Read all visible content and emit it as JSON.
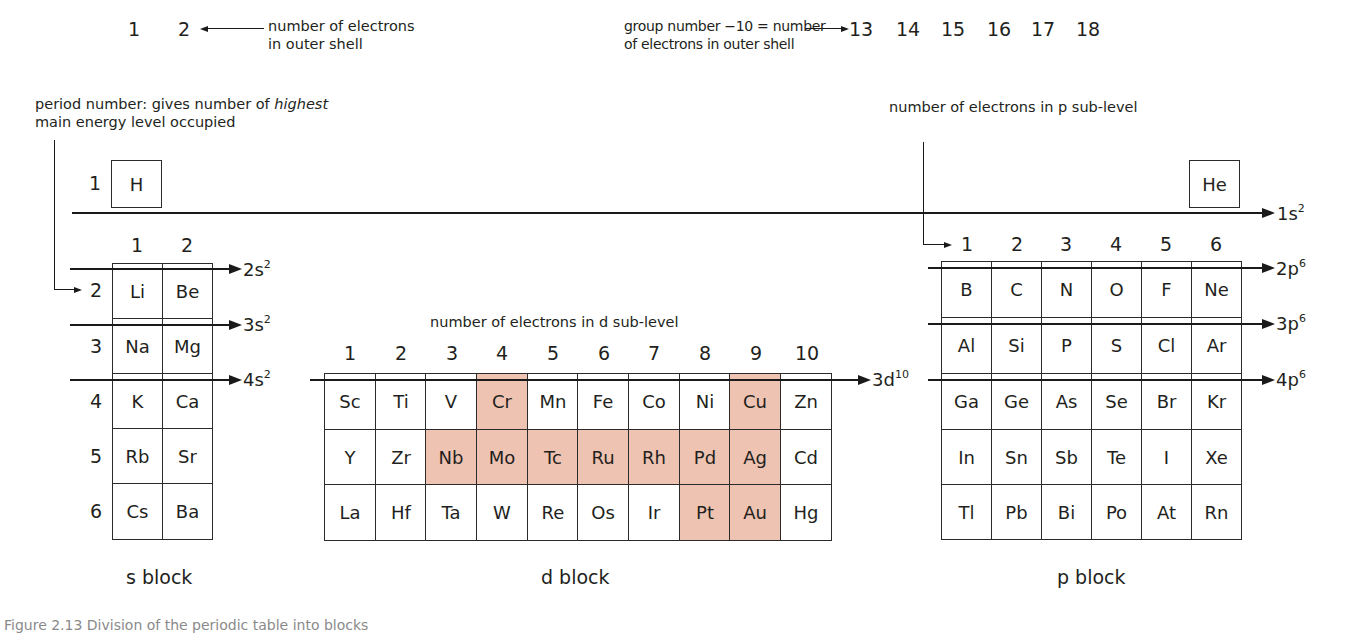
{
  "annotations": {
    "s_groups": [
      "1",
      "2"
    ],
    "outer_shell_label": [
      "number of electrons",
      "in outer shell"
    ],
    "p_group_note": [
      "group number −10 = number",
      "of electrons in outer shell"
    ],
    "p_groups": [
      "13",
      "14",
      "15",
      "16",
      "17",
      "18"
    ],
    "period_note_pre": "period number: gives number of ",
    "period_note_em": "highest",
    "period_note_line2": "main energy level occupied",
    "p_sublevel_note": "number of electrons in p sub-level",
    "d_sublevel_note": "number of electrons in d sub-level"
  },
  "period1": {
    "number": "1",
    "elements": [
      "H",
      "He"
    ],
    "orbital": {
      "base": "1s",
      "sup": "2"
    }
  },
  "s_block": {
    "name": "s block",
    "column_labels": [
      "1",
      "2"
    ],
    "periods": [
      "2",
      "3",
      "4",
      "5",
      "6"
    ],
    "rows": [
      [
        "Li",
        "Be"
      ],
      [
        "Na",
        "Mg"
      ],
      [
        "K",
        "Ca"
      ],
      [
        "Rb",
        "Sr"
      ],
      [
        "Cs",
        "Ba"
      ]
    ],
    "orbitals": [
      {
        "base": "2s",
        "sup": "2"
      },
      {
        "base": "3s",
        "sup": "2"
      },
      {
        "base": "4s",
        "sup": "2"
      }
    ]
  },
  "d_block": {
    "name": "d block",
    "column_labels": [
      "1",
      "2",
      "3",
      "4",
      "5",
      "6",
      "7",
      "8",
      "9",
      "10"
    ],
    "rows": [
      [
        "Sc",
        "Ti",
        "V",
        "Cr",
        "Mn",
        "Fe",
        "Co",
        "Ni",
        "Cu",
        "Zn"
      ],
      [
        "Y",
        "Zr",
        "Nb",
        "Mo",
        "Tc",
        "Ru",
        "Rh",
        "Pd",
        "Ag",
        "Cd"
      ],
      [
        "La",
        "Hf",
        "Ta",
        "W",
        "Re",
        "Os",
        "Ir",
        "Pt",
        "Au",
        "Hg"
      ]
    ],
    "highlighted": [
      "Cr",
      "Cu",
      "Nb",
      "Mo",
      "Tc",
      "Ru",
      "Rh",
      "Pd",
      "Ag",
      "Pt",
      "Au"
    ],
    "highlight_color": "#efc3b1",
    "orbital": {
      "base": "3d",
      "sup": "10"
    }
  },
  "p_block": {
    "name": "p block",
    "column_labels": [
      "1",
      "2",
      "3",
      "4",
      "5",
      "6"
    ],
    "rows": [
      [
        "B",
        "C",
        "N",
        "O",
        "F",
        "Ne"
      ],
      [
        "Al",
        "Si",
        "P",
        "S",
        "Cl",
        "Ar"
      ],
      [
        "Ga",
        "Ge",
        "As",
        "Se",
        "Br",
        "Kr"
      ],
      [
        "In",
        "Sn",
        "Sb",
        "Te",
        "I",
        "Xe"
      ],
      [
        "Tl",
        "Pb",
        "Bi",
        "Po",
        "At",
        "Rn"
      ]
    ],
    "orbitals": [
      {
        "base": "2p",
        "sup": "6"
      },
      {
        "base": "3p",
        "sup": "6"
      },
      {
        "base": "4p",
        "sup": "6"
      }
    ]
  },
  "caption": "Figure 2.13 Division of the periodic table into blocks"
}
